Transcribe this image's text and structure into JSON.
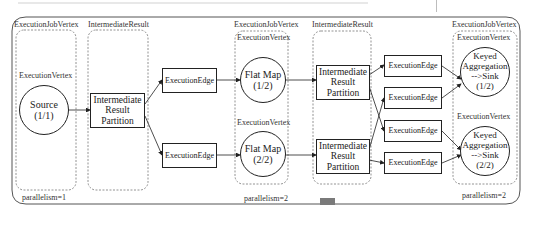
{
  "diagram": {
    "type": "flink-execution-graph",
    "columns": [
      {
        "id": "source-jobvertex",
        "title": "ExecutionJobVertex",
        "vertex_label": "ExecutionVertex",
        "vertices": [
          {
            "label": "Source\n(1/1)"
          }
        ],
        "footer": "parallelism=1"
      },
      {
        "id": "result-1",
        "title": "IntermediateResult",
        "partitions": [
          {
            "label": "Intermediate\nResult\nPartition"
          }
        ]
      },
      {
        "id": "edges-1",
        "edges": [
          {
            "label": "ExecutionEdge"
          },
          {
            "label": "ExecutionEdge"
          }
        ]
      },
      {
        "id": "flatmap-jobvertex",
        "title": "ExecutionJobVertex",
        "vertices": [
          {
            "vertex_label": "ExecutionVertex",
            "label": "Flat Map\n(1/2)"
          },
          {
            "vertex_label": "ExecutionVertex",
            "label": "Flat Map\n(2/2)"
          }
        ],
        "footer": "parallelism=2"
      },
      {
        "id": "result-2",
        "title": "IntermediateResult",
        "partitions": [
          {
            "label": "Intermediate\nResult\nPartition"
          },
          {
            "label": "Intermediate\nResult\nPartition"
          }
        ]
      },
      {
        "id": "edges-2",
        "edges": [
          {
            "label": "ExecutionEdge"
          },
          {
            "label": "ExecutionEdge"
          },
          {
            "label": "ExecutionEdge"
          },
          {
            "label": "ExecutionEdge"
          }
        ]
      },
      {
        "id": "sink-jobvertex",
        "title": "ExecutionJobVertex",
        "vertices": [
          {
            "vertex_label": "ExecutionVertex",
            "label": "Keyed\nAggregation\n-->Sink\n(1/2)"
          },
          {
            "vertex_label": "ExecutionVertex",
            "label": "Keyed\nAggregation\n-->Sink\n(2/2)"
          }
        ],
        "footer": "parallelism=2"
      }
    ],
    "colors": {
      "stroke": "#222222",
      "dashed": "#777777",
      "frame": "#555555",
      "scroll_marker": "#7a7a7a"
    }
  }
}
